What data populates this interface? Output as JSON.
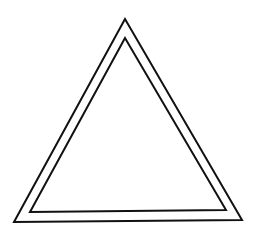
{
  "figure": {
    "background": "#ffffff",
    "stroke_color": "#111111",
    "stroke_width": 2,
    "outer_triangle": {
      "points": "125,19 14,222 242,220"
    },
    "inner_triangle": {
      "points": "125,38 30,212 226,210"
    }
  }
}
